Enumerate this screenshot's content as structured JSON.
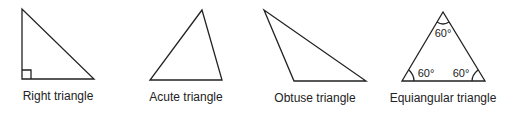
{
  "figure": {
    "triangles": [
      {
        "name": "right",
        "label": "Right triangle"
      },
      {
        "name": "acute",
        "label": "Acute triangle"
      },
      {
        "name": "obtuse",
        "label": "Obtuse triangle"
      },
      {
        "name": "equiangular",
        "label": "Equiangular triangle",
        "angles": [
          "60°",
          "60°",
          "60°"
        ]
      }
    ]
  },
  "colors": {
    "stroke": "#222222",
    "background": "#ffffff"
  }
}
